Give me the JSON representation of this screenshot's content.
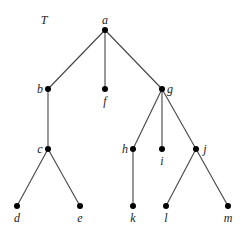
{
  "diagram": {
    "title": "T",
    "nodes": [
      {
        "id": "a",
        "label": "a",
        "x": 105,
        "y": 30,
        "lx": 105,
        "ly": 24,
        "anchor": "middle"
      },
      {
        "id": "b",
        "label": "b",
        "x": 48,
        "y": 89,
        "lx": 40,
        "ly": 93,
        "anchor": "middle"
      },
      {
        "id": "f",
        "label": "f",
        "x": 105,
        "y": 89,
        "lx": 105,
        "ly": 105,
        "anchor": "middle"
      },
      {
        "id": "g",
        "label": "g",
        "x": 162,
        "y": 89,
        "lx": 170,
        "ly": 93,
        "anchor": "middle"
      },
      {
        "id": "c",
        "label": "c",
        "x": 48,
        "y": 149,
        "lx": 40,
        "ly": 153,
        "anchor": "middle"
      },
      {
        "id": "h",
        "label": "h",
        "x": 133,
        "y": 149,
        "lx": 125,
        "ly": 153,
        "anchor": "middle"
      },
      {
        "id": "i",
        "label": "i",
        "x": 162,
        "y": 149,
        "lx": 162,
        "ly": 165,
        "anchor": "middle"
      },
      {
        "id": "j",
        "label": "j",
        "x": 196,
        "y": 149,
        "lx": 205,
        "ly": 153,
        "anchor": "middle"
      },
      {
        "id": "d",
        "label": "d",
        "x": 17,
        "y": 206,
        "lx": 17,
        "ly": 222,
        "anchor": "middle"
      },
      {
        "id": "e",
        "label": "e",
        "x": 80,
        "y": 206,
        "lx": 80,
        "ly": 222,
        "anchor": "middle"
      },
      {
        "id": "k",
        "label": "k",
        "x": 133,
        "y": 206,
        "lx": 133,
        "ly": 222,
        "anchor": "middle"
      },
      {
        "id": "l",
        "label": "l",
        "x": 166,
        "y": 206,
        "lx": 166,
        "ly": 222,
        "anchor": "middle"
      },
      {
        "id": "m",
        "label": "m",
        "x": 228,
        "y": 206,
        "lx": 228,
        "ly": 222,
        "anchor": "middle"
      }
    ],
    "edges": [
      [
        "a",
        "b"
      ],
      [
        "a",
        "f"
      ],
      [
        "a",
        "g"
      ],
      [
        "b",
        "c"
      ],
      [
        "c",
        "d"
      ],
      [
        "c",
        "e"
      ],
      [
        "g",
        "h"
      ],
      [
        "g",
        "i"
      ],
      [
        "g",
        "j"
      ],
      [
        "h",
        "k"
      ],
      [
        "j",
        "l"
      ],
      [
        "j",
        "m"
      ]
    ]
  }
}
